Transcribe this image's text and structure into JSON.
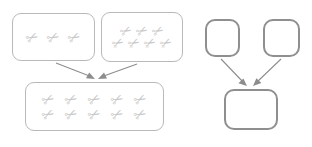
{
  "diagram": {
    "item_glyph": "✂",
    "item_name": "scissors-icon",
    "colors": {
      "background": "#ffffff",
      "thin_box_border": "#b9b9b9",
      "thick_box_border": "#8f8f8f",
      "arrow": "#8d8d8d",
      "item": "#c9c9c9"
    },
    "concrete": {
      "label": "concrete-group",
      "addend_a": {
        "label": "addend-box-a",
        "count": 3,
        "rows": [
          3
        ]
      },
      "addend_b": {
        "label": "addend-box-b",
        "count": 7,
        "rows": [
          3,
          4
        ]
      },
      "sum": {
        "label": "sum-box",
        "count": 10,
        "rows": [
          5,
          5
        ]
      },
      "arrows": [
        {
          "label": "arrow-from-addend-a",
          "from": "addend_a",
          "to": "sum"
        },
        {
          "label": "arrow-from-addend-b",
          "from": "addend_b",
          "to": "sum"
        }
      ]
    },
    "abstract": {
      "label": "abstract-group",
      "addend_a": {
        "label": "abstract-addend-box-a",
        "content": ""
      },
      "addend_b": {
        "label": "abstract-addend-box-b",
        "content": ""
      },
      "sum": {
        "label": "abstract-sum-box",
        "content": ""
      },
      "arrows": [
        {
          "label": "abstract-arrow-from-a",
          "from": "addend_a",
          "to": "sum"
        },
        {
          "label": "abstract-arrow-from-b",
          "from": "addend_b",
          "to": "sum"
        }
      ]
    }
  }
}
